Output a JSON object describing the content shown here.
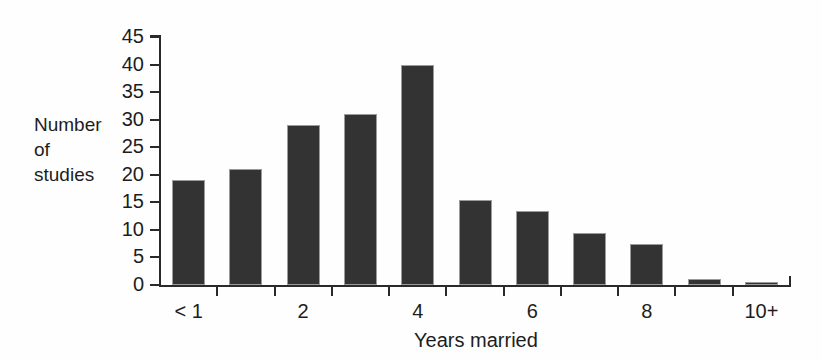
{
  "chart_data": {
    "type": "bar",
    "title": "",
    "xlabel": "Years married",
    "ylabel": "Number\nof\nstudies",
    "categories": [
      "< 1",
      "1",
      "2",
      "3",
      "4",
      "5",
      "6",
      "7",
      "8",
      "9",
      "10+"
    ],
    "tick_labels_shown": [
      "< 1",
      "",
      "2",
      "",
      "4",
      "",
      "6",
      "",
      "8",
      "",
      "10+"
    ],
    "values": [
      19,
      21,
      29,
      31,
      40,
      15.5,
      13.5,
      9.5,
      7.5,
      1,
      0.3
    ],
    "ylim": [
      0,
      45
    ],
    "yticks": [
      0,
      5,
      10,
      15,
      20,
      25,
      30,
      35,
      40,
      45
    ],
    "ytick_labels": [
      "0",
      "5",
      "10",
      "15",
      "20",
      "25",
      "30",
      "35",
      "40",
      "45"
    ],
    "grid": false,
    "legend": false,
    "bar_color": "#333333",
    "bar_edge_color": "#9b9b9b",
    "axis_color": "#2a2a2a",
    "background_color": "#fefefe"
  }
}
